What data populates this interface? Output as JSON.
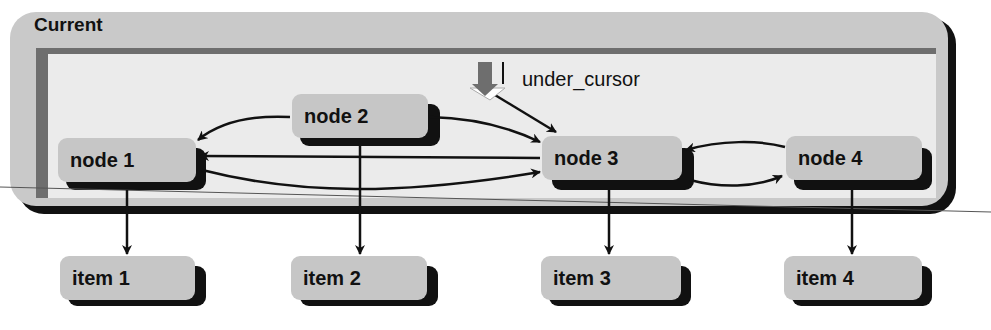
{
  "frame": {
    "title": "Current"
  },
  "cursor": {
    "label": "under_cursor",
    "icon": "down-arrow-cursor-icon"
  },
  "nodes": [
    {
      "id": "node1",
      "label": "node 1"
    },
    {
      "id": "node2",
      "label": "node 2"
    },
    {
      "id": "node3",
      "label": "node 3"
    },
    {
      "id": "node4",
      "label": "node 4"
    }
  ],
  "items": [
    {
      "id": "item1",
      "label": "item 1"
    },
    {
      "id": "item2",
      "label": "item 2"
    },
    {
      "id": "item3",
      "label": "item 3"
    },
    {
      "id": "item4",
      "label": "item 4"
    }
  ],
  "edges": [
    {
      "from": "node2",
      "to": "node1"
    },
    {
      "from": "node2",
      "to": "node3"
    },
    {
      "from": "node3",
      "to": "node1"
    },
    {
      "from": "node1",
      "to": "node3"
    },
    {
      "from": "node4",
      "to": "node3"
    },
    {
      "from": "node3",
      "to": "node4"
    },
    {
      "from": "under_cursor",
      "to": "node3"
    },
    {
      "from": "node1",
      "to": "item1"
    },
    {
      "from": "node2",
      "to": "item2"
    },
    {
      "from": "node3",
      "to": "item3"
    },
    {
      "from": "node4",
      "to": "item4"
    }
  ]
}
